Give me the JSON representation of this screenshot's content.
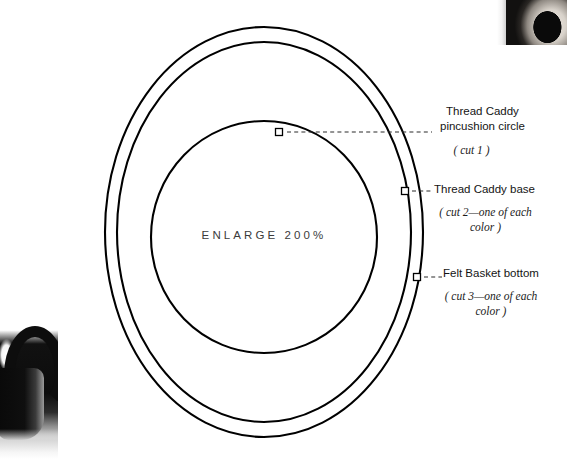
{
  "page": {
    "center_caption": "ENLARGE 200%"
  },
  "diagram": {
    "name": "concentric-pattern-circles",
    "stroke_color": "#000000",
    "background_color": "#ffffff",
    "circles": [
      {
        "name": "outer-ring",
        "cx": 264,
        "cy": 232,
        "rx": 159,
        "ry": 205,
        "stroke_width": 2.1
      },
      {
        "name": "middle-ring",
        "cx": 264,
        "cy": 232,
        "rx": 147,
        "ry": 190,
        "stroke_width": 2.1
      },
      {
        "name": "inner-ring",
        "cx": 264,
        "cy": 237,
        "rx": 113,
        "ry": 116,
        "stroke_width": 2.1
      }
    ]
  },
  "callouts": [
    {
      "id": "pincushion",
      "label_line1": "Thread Caddy",
      "label_line2": "pincushion circle",
      "cut_note": "( cut 1 )",
      "marker": {
        "x": 279,
        "y": 132
      },
      "leader": {
        "x1": 287,
        "y1": 132,
        "x2": 432,
        "y2": 132
      }
    },
    {
      "id": "caddy-base",
      "label": "Thread Caddy base",
      "cut_note_line1": "( cut 2—one of each",
      "cut_note_line2": "color )",
      "marker": {
        "x": 405,
        "y": 191
      },
      "leader": {
        "x1": 412,
        "y1": 191,
        "x2": 433,
        "y2": 191
      }
    },
    {
      "id": "felt-basket",
      "label": "Felt Basket bottom",
      "cut_note_line1": "( cut 3—one of each",
      "cut_note_line2": "color )",
      "marker": {
        "x": 417,
        "y": 277
      },
      "leader": {
        "x1": 424,
        "y1": 277,
        "x2": 442,
        "y2": 277
      }
    }
  ],
  "photos": [
    {
      "id": "top-right",
      "description": "cropped dark product photo fragment"
    },
    {
      "id": "bottom-left",
      "description": "cropped dark basket handle photo fragment"
    }
  ]
}
